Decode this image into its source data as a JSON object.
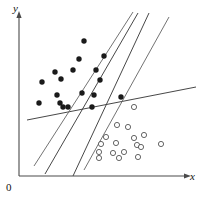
{
  "figure": {
    "title": "",
    "background_color": "#ffffff"
  },
  "axes": {
    "x_label": "x",
    "y_label": "y",
    "origin_label": "0",
    "axis_color": "#4a4a4a",
    "x_axis": {
      "x1": 19,
      "y1": 176,
      "x2": 186,
      "y2": 176
    },
    "y_axis": {
      "x1": 19,
      "y1": 176,
      "x2": 19,
      "y2": 16
    },
    "x_label_pos": {
      "x": 190,
      "y": 180
    },
    "y_label_pos": {
      "x": 13,
      "y": 12
    },
    "origin_label_pos": {
      "x": 6,
      "y": 191
    }
  },
  "chart_data": {
    "type": "scatter",
    "title": "",
    "xlabel": "x",
    "ylabel": "y",
    "grid": false,
    "legend_position": "none",
    "xlim": [
      0,
      202
    ],
    "ylim": [
      0,
      198
    ],
    "note": "Two-class scatter plot in pixel coordinates with several candidate separating lines drawn.",
    "series": [
      {
        "name": "class-filled",
        "marker": "filled-circle",
        "color": "#1a1a1a",
        "radius": 2.7,
        "count": 18,
        "points": [
          [
            84,
            41
          ],
          [
            79,
            59
          ],
          [
            104,
            56
          ],
          [
            73,
            70
          ],
          [
            55,
            72
          ],
          [
            61,
            79
          ],
          [
            96,
            70
          ],
          [
            100,
            80
          ],
          [
            42,
            82
          ],
          [
            82,
            93
          ],
          [
            57,
            95
          ],
          [
            39,
            103
          ],
          [
            60,
            103
          ],
          [
            63,
            107
          ],
          [
            68,
            107
          ],
          [
            94,
            95
          ],
          [
            121,
            97
          ],
          [
            92,
            107
          ]
        ]
      },
      {
        "name": "class-open",
        "marker": "open-circle",
        "color": "#555555",
        "radius": 2.6,
        "count": 17,
        "points": [
          [
            134,
            107
          ],
          [
            117,
            125
          ],
          [
            128,
            127
          ],
          [
            134,
            138
          ],
          [
            106,
            137
          ],
          [
            101,
            144
          ],
          [
            116,
            143
          ],
          [
            137,
            145
          ],
          [
            99,
            152
          ],
          [
            113,
            153
          ],
          [
            124,
            152
          ],
          [
            144,
            135
          ],
          [
            141,
            147
          ],
          [
            161,
            144
          ],
          [
            99,
            158
          ],
          [
            119,
            158
          ],
          [
            138,
            157
          ]
        ]
      }
    ],
    "lines": [
      {
        "name": "shallow-line",
        "color": "#3d3d3d",
        "x1": 27,
        "y1": 120,
        "x2": 196,
        "y2": 87
      },
      {
        "name": "steep-line-1",
        "color": "#6b6b6b",
        "x1": 34,
        "y1": 166,
        "x2": 133,
        "y2": 12
      },
      {
        "name": "steep-line-2",
        "color": "#3d3d3d",
        "x1": 45,
        "y1": 174,
        "x2": 138,
        "y2": 13
      },
      {
        "name": "steep-line-3",
        "color": "#3d3d3d",
        "x1": 73,
        "y1": 176,
        "x2": 149,
        "y2": 13
      },
      {
        "name": "steep-line-4",
        "color": "#6b6b6b",
        "x1": 84,
        "y1": 170,
        "x2": 169,
        "y2": 17
      }
    ]
  }
}
